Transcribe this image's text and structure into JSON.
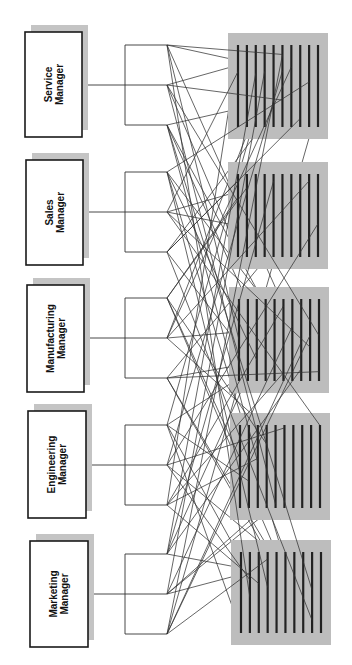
{
  "diagram": {
    "title": "",
    "orientation": "rotated-90-ccw",
    "colors": {
      "background": "#ffffff",
      "box_border": "#1a1a1a",
      "shadow": "#c4c4c4",
      "pool_fill": "#bdbdbd",
      "worker_line": "#222222",
      "connector": "#333333"
    },
    "managers": [
      {
        "id": "service",
        "line1": "Service",
        "line2": "Manager",
        "box": {
          "x": 25,
          "y": 32,
          "w": 57,
          "h": 105
        },
        "center_y": 85
      },
      {
        "id": "sales",
        "line1": "Sales",
        "line2": "Manager",
        "box": {
          "x": 26,
          "y": 160,
          "w": 57,
          "h": 105
        },
        "center_y": 212
      },
      {
        "id": "manufacturing",
        "line1": "Manufacturing",
        "line2": "Manager",
        "box": {
          "x": 27,
          "y": 285,
          "w": 57,
          "h": 107
        },
        "center_y": 338
      },
      {
        "id": "engineering",
        "line1": "Engineering",
        "line2": "Manager",
        "box": {
          "x": 28,
          "y": 411,
          "w": 58,
          "h": 107
        },
        "center_y": 465
      },
      {
        "id": "marketing",
        "line1": "Marketing",
        "line2": "Manager",
        "box": {
          "x": 30,
          "y": 541,
          "w": 58,
          "h": 106
        },
        "center_y": 594
      }
    ],
    "brackets": {
      "spine_x": 125,
      "branch_end_x": 167,
      "branch_offsets": [
        -40,
        0,
        40
      ]
    },
    "worker_pools": [
      {
        "id": "pool-1",
        "x": 228,
        "y": 33,
        "w": 100,
        "h": 106,
        "line_count": 10
      },
      {
        "id": "pool-2",
        "x": 228,
        "y": 162,
        "w": 100,
        "h": 107,
        "line_count": 10
      },
      {
        "id": "pool-3",
        "x": 229,
        "y": 287,
        "w": 100,
        "h": 106,
        "line_count": 10
      },
      {
        "id": "pool-4",
        "x": 230,
        "y": 413,
        "w": 100,
        "h": 107,
        "line_count": 10
      },
      {
        "id": "pool-5",
        "x": 231,
        "y": 540,
        "w": 100,
        "h": 105,
        "line_count": 10
      }
    ],
    "connections_per_endpoint": 5
  }
}
